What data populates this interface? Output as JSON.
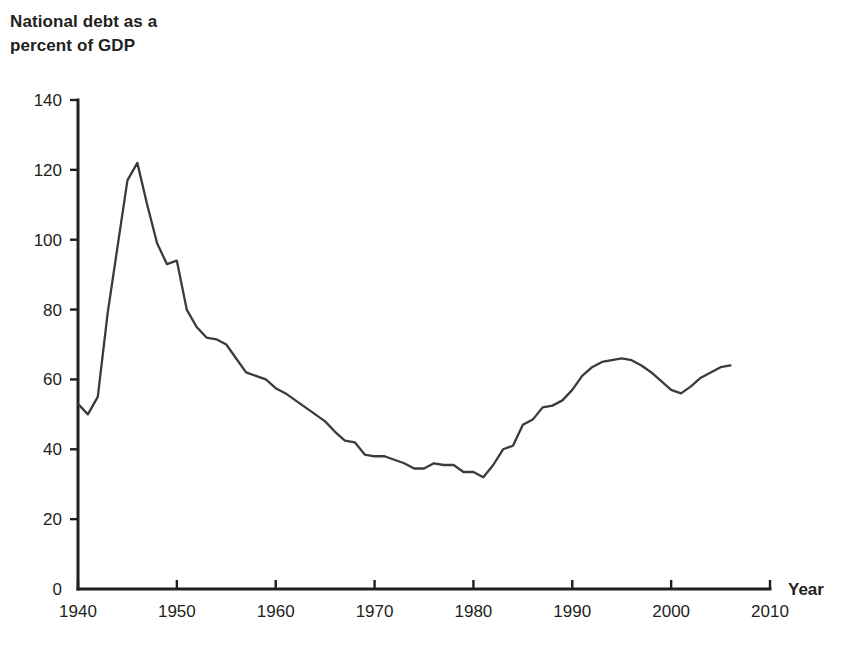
{
  "chart_data": {
    "type": "line",
    "title": "National debt as a\npercent of GDP",
    "xlabel": "Year",
    "ylabel": "",
    "xlim": [
      1940,
      2010
    ],
    "ylim": [
      0,
      140
    ],
    "grid": false,
    "legend": null,
    "xticks": [
      1940,
      1950,
      1960,
      1970,
      1980,
      1990,
      2000,
      2010
    ],
    "yticks": [
      0,
      20,
      40,
      60,
      80,
      100,
      120,
      140
    ],
    "line_color": "#3b3b3b",
    "series": [
      {
        "name": "National debt as a percent of GDP",
        "x": [
          1940,
          1941,
          1942,
          1943,
          1944,
          1945,
          1946,
          1947,
          1948,
          1949,
          1950,
          1951,
          1952,
          1953,
          1954,
          1955,
          1956,
          1957,
          1958,
          1959,
          1960,
          1961,
          1962,
          1963,
          1964,
          1965,
          1966,
          1967,
          1968,
          1969,
          1970,
          1971,
          1972,
          1973,
          1974,
          1975,
          1976,
          1977,
          1978,
          1979,
          1980,
          1981,
          1982,
          1983,
          1984,
          1985,
          1986,
          1987,
          1988,
          1989,
          1990,
          1991,
          1992,
          1993,
          1994,
          1995,
          1996,
          1997,
          1998,
          1999,
          2000,
          2001,
          2002,
          2003,
          2004,
          2005,
          2006
        ],
        "y": [
          53,
          50,
          55,
          79,
          98,
          117,
          122,
          110,
          99,
          93,
          94,
          80,
          75,
          72,
          71.5,
          70,
          66,
          62,
          61,
          60,
          57.5,
          56,
          54,
          52,
          50,
          48,
          45,
          42.5,
          42,
          38.5,
          38,
          38,
          37,
          36,
          34.5,
          34.5,
          36,
          35.5,
          35.5,
          33.5,
          33.5,
          32,
          35.5,
          40,
          41,
          47,
          48.5,
          52,
          52.5,
          54,
          57,
          61,
          63.5,
          65,
          65.5,
          66,
          65.5,
          64,
          62,
          59.5,
          57,
          56,
          58,
          60.5,
          62,
          63.5,
          64
        ]
      }
    ],
    "annotations": []
  },
  "axes": {
    "y_tick_labels": [
      "140",
      "120",
      "100",
      "80",
      "60",
      "40",
      "20",
      "0"
    ],
    "x_tick_labels": [
      "1940",
      "1950",
      "1960",
      "1970",
      "1980",
      "1990",
      "2000",
      "2010"
    ],
    "x_axis_name": "Year"
  }
}
